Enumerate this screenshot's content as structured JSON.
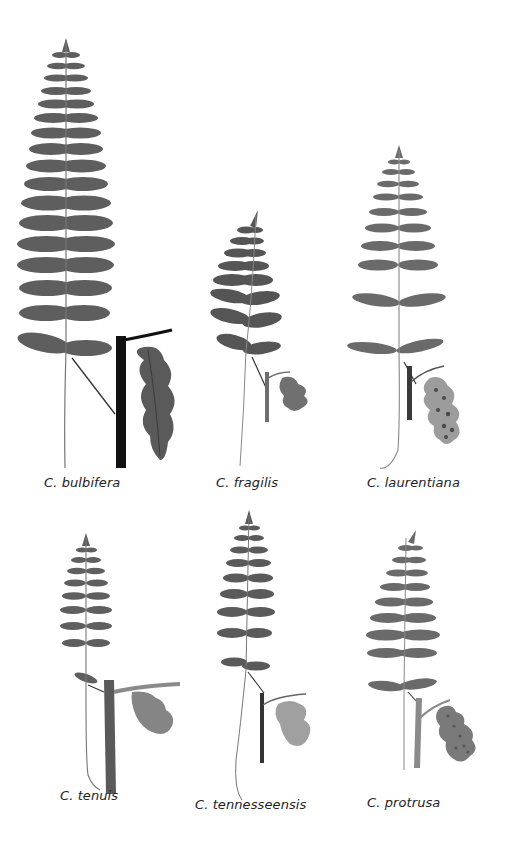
{
  "figure": {
    "panels": [
      {
        "id": "bulbifera",
        "label": "C. bulbifera",
        "row": 1,
        "col": 1,
        "frond_tone": "#5e5e5e",
        "stem_tone": "#111111",
        "pinnule_tone": "#5a5a5a"
      },
      {
        "id": "fragilis",
        "label": "C. fragilis",
        "row": 1,
        "col": 2,
        "frond_tone": "#555555",
        "stem_tone": "#6e6e6e",
        "pinnule_tone": "#707070"
      },
      {
        "id": "laurentiana",
        "label": "C. laurentiana",
        "row": 1,
        "col": 3,
        "frond_tone": "#6a6a6a",
        "stem_tone": "#3a3a3a",
        "pinnule_tone": "#9c9c9c",
        "sori": true
      },
      {
        "id": "tenuis",
        "label": "C. tenuis",
        "row": 2,
        "col": 1,
        "frond_tone": "#5f5f5f",
        "stem_tone": "#5a5a5a",
        "pinnule_tone": "#858585"
      },
      {
        "id": "tennesseensis",
        "label": "C. tennesseensis",
        "row": 2,
        "col": 2,
        "frond_tone": "#5a5a5a",
        "stem_tone": "#333333",
        "pinnule_tone": "#a0a0a0"
      },
      {
        "id": "protrusa",
        "label": "C. protrusa",
        "row": 2,
        "col": 3,
        "frond_tone": "#6a6a6a",
        "stem_tone": "#8a8a8a",
        "pinnule_tone": "#7a7a7a",
        "sori": true
      }
    ]
  }
}
